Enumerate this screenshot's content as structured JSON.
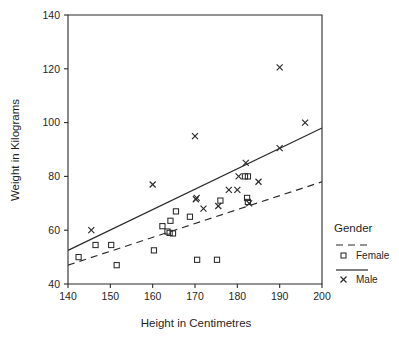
{
  "chart_data": {
    "type": "scatter",
    "title": "",
    "xlabel": "Height in Centimetres",
    "ylabel": "Weight in Kilograms",
    "xlim": [
      140,
      200
    ],
    "ylim": [
      40,
      140
    ],
    "xticks": [
      140,
      150,
      160,
      170,
      180,
      190,
      200
    ],
    "yticks": [
      40,
      60,
      80,
      100,
      120,
      140
    ],
    "grid": false,
    "legend": {
      "title": "Gender",
      "position": "right",
      "entries": [
        {
          "name": "Female",
          "marker": "square",
          "line": "dashed"
        },
        {
          "name": "Male",
          "marker": "cross",
          "line": "solid"
        }
      ]
    },
    "series": [
      {
        "name": "Female",
        "marker": "square",
        "points": [
          [
            142.5,
            50
          ],
          [
            146.5,
            54.5
          ],
          [
            150.2,
            54.5
          ],
          [
            151.5,
            47
          ],
          [
            160.3,
            52.5
          ],
          [
            162.3,
            61.5
          ],
          [
            163.5,
            59.5
          ],
          [
            164.0,
            59.0
          ],
          [
            164.8,
            58.8
          ],
          [
            164.2,
            63.5
          ],
          [
            165.5,
            67
          ],
          [
            168.8,
            65
          ],
          [
            170.5,
            49
          ],
          [
            175.2,
            49
          ],
          [
            176.0,
            71
          ],
          [
            181.8,
            80
          ],
          [
            182.5,
            80
          ],
          [
            182.3,
            72
          ],
          [
            182.5,
            70.5
          ]
        ]
      },
      {
        "name": "Male",
        "marker": "cross",
        "points": [
          [
            145.5,
            60
          ],
          [
            160.0,
            77
          ],
          [
            170.0,
            95
          ],
          [
            170.2,
            71.5
          ],
          [
            170.4,
            72.0
          ],
          [
            172.0,
            68
          ],
          [
            175.5,
            69
          ],
          [
            178.0,
            75
          ],
          [
            180.0,
            75
          ],
          [
            180.3,
            80
          ],
          [
            182.0,
            85
          ],
          [
            182.8,
            70
          ],
          [
            185.0,
            78
          ],
          [
            190.0,
            120.5
          ],
          [
            190.0,
            90.5
          ],
          [
            196.0,
            100
          ]
        ]
      }
    ],
    "fit_lines": [
      {
        "name": "Male",
        "style": "solid",
        "x0": 140,
        "y0": 52.5,
        "x1": 200,
        "y1": 98
      },
      {
        "name": "Female",
        "style": "dashed",
        "x0": 140,
        "y0": 47,
        "x1": 200,
        "y1": 78
      }
    ]
  }
}
